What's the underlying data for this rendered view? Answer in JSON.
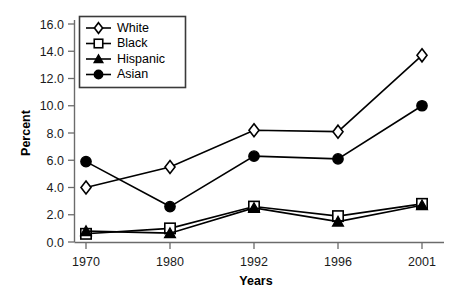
{
  "chart_data": {
    "type": "line",
    "title": "",
    "subtitle": "",
    "xlabel": "Years",
    "ylabel": "Percent",
    "categories": [
      "1970",
      "1980",
      "1992",
      "1996",
      "2001"
    ],
    "x_tick_labels": [
      "1970",
      "1980",
      "1992",
      "1996",
      "2001"
    ],
    "y_tick_labels": [
      "0.0",
      "2.0",
      "4.0",
      "6.0",
      "8.0",
      "10.0",
      "12.0",
      "14.0",
      "16.0"
    ],
    "y_ticks": [
      0.0,
      2.0,
      4.0,
      6.0,
      8.0,
      10.0,
      12.0,
      14.0,
      16.0
    ],
    "ylim": [
      0.0,
      16.0
    ],
    "grid": false,
    "legend_position": "top-left-inside",
    "series": [
      {
        "name": "White",
        "marker": "open-diamond",
        "color": "#000000",
        "values": [
          4.0,
          5.5,
          8.2,
          8.1,
          13.7
        ]
      },
      {
        "name": "Black",
        "marker": "open-square",
        "color": "#000000",
        "values": [
          0.6,
          1.0,
          2.6,
          1.9,
          2.8
        ]
      },
      {
        "name": "Hispanic",
        "marker": "filled-triangle",
        "color": "#000000",
        "values": [
          0.8,
          0.65,
          2.5,
          1.5,
          2.7
        ]
      },
      {
        "name": "Asian",
        "marker": "filled-circle",
        "color": "#000000",
        "values": [
          5.9,
          2.6,
          6.3,
          6.1,
          10.0
        ]
      }
    ]
  },
  "legend": {
    "entries": [
      {
        "label": "White",
        "marker": "open-diamond"
      },
      {
        "label": "Black",
        "marker": "open-square"
      },
      {
        "label": "Hispanic",
        "marker": "filled-triangle"
      },
      {
        "label": "Asian",
        "marker": "filled-circle"
      }
    ]
  },
  "axes": {
    "y_title": "Percent",
    "x_title": "Years"
  }
}
